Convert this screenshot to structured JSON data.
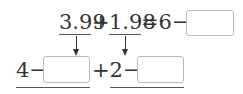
{
  "top_line": {
    "term1": "3.99",
    "plus": "+",
    "term2": "1.98",
    "equals_part": "=6−",
    "answer_box": ""
  },
  "bottom_line": {
    "part1_prefix": "4−",
    "box1": "",
    "part2_prefix": "+2−",
    "box2": ""
  }
}
